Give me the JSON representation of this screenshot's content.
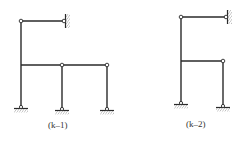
{
  "figures": [
    {
      "id": "k-1",
      "label": "(k–1)",
      "description": "Frame with left column pin-supported at base, top-left hinge connected by beam to wall-fixed hinge, mid-level beam with two internal hinges over two pin-supported columns",
      "nodes": {
        "top_left_hinge": [
          21,
          21
        ],
        "wall_hinge": [
          64,
          21
        ],
        "beam_left": [
          21,
          65
        ],
        "mid_hinge": [
          62,
          65
        ],
        "right_hinge": [
          107,
          65
        ],
        "base_left": [
          21,
          107
        ],
        "base_mid": [
          62,
          109
        ],
        "base_right": [
          107,
          109
        ]
      },
      "supports": [
        "pin",
        "pin",
        "pin",
        "fixed-wall"
      ],
      "label_pos": [
        63,
        126
      ]
    },
    {
      "id": "k-2",
      "label": "(k–2)",
      "description": "Frame with left column pin-supported at base, top hinge connected by beam to wall-fixed hinge, mid-level beam ending at hinge over pin-supported right column",
      "nodes": {
        "top_left_hinge": [
          181,
          17
        ],
        "wall_hinge": [
          226,
          17
        ],
        "beam_left": [
          181,
          61
        ],
        "right_hinge": [
          223,
          61
        ],
        "base_left": [
          181,
          103
        ],
        "base_right": [
          223,
          106
        ]
      },
      "supports": [
        "pin",
        "pin",
        "fixed-wall"
      ],
      "label_pos": [
        201,
        125
      ]
    }
  ]
}
